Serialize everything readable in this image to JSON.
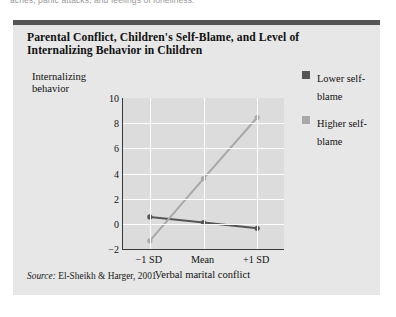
{
  "page": {
    "running_text": "aches, panic attacks, and feelings of loneliness."
  },
  "figure": {
    "title": "Parental Conflict, Children's Self-Blame, and Level of Internalizing Behavior in Children",
    "source_word": "Source:",
    "source_text": " El-Sheikh & Harger, 2001.",
    "colors": {
      "panel_background": "#e7e7e7",
      "panel_topbar": "#565656",
      "plot_background": "#dcdcdc",
      "gridline": "#ffffff",
      "axis": "#3a3a3a",
      "lower_self_blame": "#555555",
      "higher_self_blame": "#a8a8a8"
    },
    "legend": {
      "position": "right",
      "items": [
        {
          "label": "Lower self-blame",
          "color": "#555555",
          "marker": "square"
        },
        {
          "label": "Higher self-blame",
          "color": "#a8a8a8",
          "marker": "square"
        }
      ]
    }
  },
  "chart_data": {
    "type": "line",
    "title": "Parental Conflict, Children's Self-Blame, and Level of Internalizing Behavior in Children",
    "categories": [
      "-1 SD",
      "Mean",
      "+1 SD"
    ],
    "series": [
      {
        "name": "Lower self-blame",
        "values": [
          0.55,
          0.1,
          -0.35
        ],
        "color": "#555555"
      },
      {
        "name": "Higher self-blame",
        "values": [
          -1.35,
          3.6,
          8.45
        ],
        "color": "#a8a8a8"
      }
    ],
    "xlabel": "Verbal marital conflict",
    "ylabel": "Internalizing behavior",
    "ylim": [
      -2,
      10
    ],
    "yticks": [
      10,
      8,
      6,
      4,
      2,
      0,
      -2
    ],
    "ytick_labels": [
      "10",
      "8",
      "6",
      "4",
      "2",
      "0",
      "-2"
    ],
    "grid": true,
    "legend_position": "right"
  }
}
